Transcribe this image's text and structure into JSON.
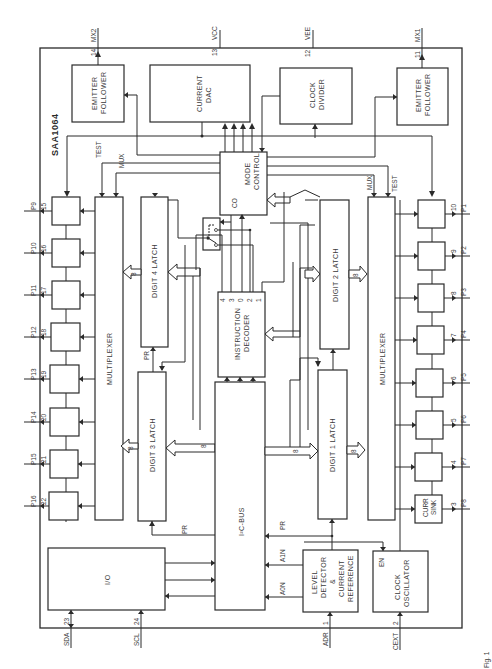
{
  "diagram": {
    "chip_name": "SAA1064",
    "orientation": "rotated-90-ccw",
    "figure_caption_fragment": "Fig. 1",
    "pins_top": [
      {
        "num": "14",
        "name": "MX2"
      },
      {
        "num": "13",
        "name": "VCC"
      },
      {
        "num": "12",
        "name": "VEE"
      },
      {
        "num": "11",
        "name": "MX1"
      }
    ],
    "pins_bottom": [
      {
        "num": "23",
        "name": "SDA"
      },
      {
        "num": "24",
        "name": "SCL"
      },
      {
        "num": "1",
        "name": "ADR"
      },
      {
        "num": "2",
        "name": "CEXT"
      }
    ],
    "pins_left": [
      {
        "num": "15",
        "name": "P9"
      },
      {
        "num": "16",
        "name": "P10"
      },
      {
        "num": "17",
        "name": "P11"
      },
      {
        "num": "18",
        "name": "P12"
      },
      {
        "num": "19",
        "name": "P13"
      },
      {
        "num": "20",
        "name": "P14"
      },
      {
        "num": "21",
        "name": "P15"
      },
      {
        "num": "22",
        "name": "P16"
      }
    ],
    "pins_right": [
      {
        "num": "10",
        "name": "P1"
      },
      {
        "num": "9",
        "name": "P2"
      },
      {
        "num": "8",
        "name": "P3"
      },
      {
        "num": "7",
        "name": "P4"
      },
      {
        "num": "6",
        "name": "P5"
      },
      {
        "num": "5",
        "name": "P6"
      },
      {
        "num": "4",
        "name": "P7"
      },
      {
        "num": "3",
        "name": "P8"
      }
    ],
    "blocks": {
      "emitter_follower_left": [
        "EMITTER",
        "FOLLOWER"
      ],
      "current_dac": [
        "CURRENT",
        "DAC"
      ],
      "clock_divider": [
        "CLOCK",
        "DIVIDER"
      ],
      "emitter_follower_right": [
        "EMITTER",
        "FOLLOWER"
      ],
      "mode_control": [
        "MODE",
        "CONTROL"
      ],
      "mode_control_co": "CO",
      "multiplexer_left": "MULTIPLEXER",
      "multiplexer_right": "MULTIPLEXER",
      "digit4_latch": "DIGIT 4 LATCH",
      "digit3_latch": "DIGIT 3 LATCH",
      "digit2_latch": "DIGIT 2 LATCH",
      "digit1_latch": "DIGIT 1 LATCH",
      "instruction_decoder": [
        "INSTRUCTION",
        "DECODER"
      ],
      "decoder_bits": [
        "4",
        "3",
        "0",
        "2",
        "1"
      ],
      "i2c_bus": "I²C-BUS",
      "io": "I/O",
      "level_detector": [
        "LEVEL",
        "DETECTOR",
        "&",
        "CURRENT",
        "REFERENCE"
      ],
      "clock_oscillator": [
        "CLOCK",
        "OSCILLATOR"
      ],
      "clock_oscillator_en": "EN",
      "curr_sink": [
        "CURR",
        "SINK"
      ]
    },
    "signals": {
      "test": "TEST",
      "mux": "MUX",
      "pr": "PR",
      "len": "LEN",
      "lco": "LCO",
      "reset": "RESET",
      "a1n": "A1N",
      "a0n": "A0N",
      "bus_width": "8"
    }
  }
}
